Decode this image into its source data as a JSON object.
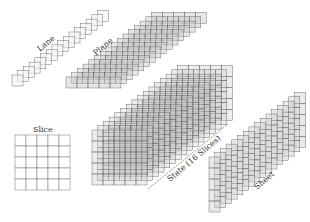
{
  "diagram": {
    "labels": {
      "lane": "Lane",
      "plane": "Plane",
      "slice": "Slice",
      "state": "State (16 Slices)",
      "sheet": "Sheet"
    },
    "colors": {
      "line": "#555555",
      "lane_fill": "#f2f2f2",
      "plane_fill": "#c8c8c8",
      "state_fill": "#cccccc",
      "sheet_fill": "#cfcfcf",
      "slice_fill": "#ffffff"
    },
    "grid": {
      "rows": 5,
      "cols": 5,
      "depth": 16
    }
  }
}
